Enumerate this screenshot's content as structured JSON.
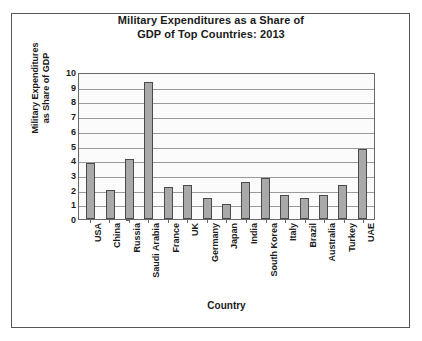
{
  "chart_data": {
    "type": "bar",
    "title": "Military Expenditures as a Share of GDP of Top Countries: 2013",
    "title_lines": [
      "Military Expenditures as a Share of",
      "GDP of Top Countries: 2013"
    ],
    "xlabel": "Country",
    "ylabel": "Military Expenditures as Share of GDP",
    "ylabel_lines": [
      "Military Expenditures",
      "as Share of GDP"
    ],
    "categories": [
      "USA",
      "China",
      "Russia",
      "Saudi Arabia",
      "France",
      "UK",
      "Germany",
      "Japan",
      "India",
      "South Korea",
      "Italy",
      "Brazil",
      "Australia",
      "Turkey",
      "UAE"
    ],
    "values": [
      3.8,
      2.0,
      4.1,
      9.3,
      2.2,
      2.3,
      1.4,
      1.0,
      2.5,
      2.8,
      1.6,
      1.4,
      1.6,
      2.3,
      4.75
    ],
    "ylim": [
      0,
      10
    ],
    "ytick_step": 1,
    "yticks": [
      0,
      1,
      2,
      3,
      4,
      5,
      6,
      7,
      8,
      9,
      10
    ],
    "grid": true,
    "legend": false,
    "bar_color": "#a9a9a9",
    "bar_border_color": "#4a4a4a",
    "plot_bg": "#fbfbfb",
    "gridline_color": "#9a9a9a",
    "axis_color": "#6a6a6a",
    "text_color": "#1a1a1a",
    "frame_color": "#555555"
  }
}
